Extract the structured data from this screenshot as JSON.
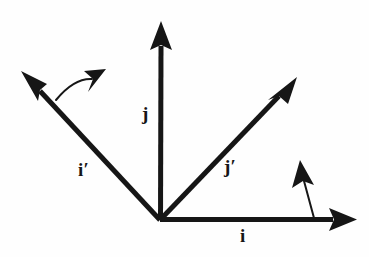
{
  "figure": {
    "kind": "vector-basis-rotation-diagram",
    "background_color": "#fefefe",
    "stroke_color": "#161616",
    "width": 369,
    "height": 257,
    "origin": {
      "x": 160,
      "y": 220
    }
  },
  "labels": {
    "j": "j",
    "i": "i",
    "i_prime": "i′",
    "j_prime": "j′"
  },
  "vectors": [
    {
      "name": "j-axis",
      "label": "j",
      "from": {
        "x": 160,
        "y": 220
      },
      "to": {
        "x": 161,
        "y": 22
      },
      "direction_deg": 90,
      "label_pos": {
        "x": 142,
        "y": 104
      }
    },
    {
      "name": "i-axis",
      "label": "i",
      "from": {
        "x": 160,
        "y": 220
      },
      "to": {
        "x": 356,
        "y": 220
      },
      "direction_deg": 0,
      "label_pos": {
        "x": 240,
        "y": 226
      }
    },
    {
      "name": "i-prime-axis",
      "label": "i′",
      "from": {
        "x": 160,
        "y": 220
      },
      "to": {
        "x": 24,
        "y": 74
      },
      "direction_deg": 133,
      "label_pos": {
        "x": 78,
        "y": 160
      }
    },
    {
      "name": "j-prime-axis",
      "label": "j′",
      "from": {
        "x": 160,
        "y": 220
      },
      "to": {
        "x": 294,
        "y": 80
      },
      "direction_deg": 46,
      "label_pos": {
        "x": 224,
        "y": 157
      }
    }
  ],
  "rotation_arcs": [
    {
      "name": "rotation-arc-left",
      "from": {
        "x": 56,
        "y": 100
      },
      "control": {
        "x": 74,
        "y": 78
      },
      "to": {
        "x": 97,
        "y": 77
      },
      "arrow_direction_deg": 28
    },
    {
      "name": "rotation-arc-right",
      "from": {
        "x": 314,
        "y": 218
      },
      "control": {
        "x": 308,
        "y": 196
      },
      "to": {
        "x": 303,
        "y": 173
      },
      "arrow_direction_deg": 103
    }
  ],
  "style": {
    "axis_stroke_width": 5,
    "arc_stroke_width": 2,
    "arrow_head_length": 26,
    "arrow_head_width": 20,
    "arc_head_length": 19,
    "arc_head_width": 17
  }
}
